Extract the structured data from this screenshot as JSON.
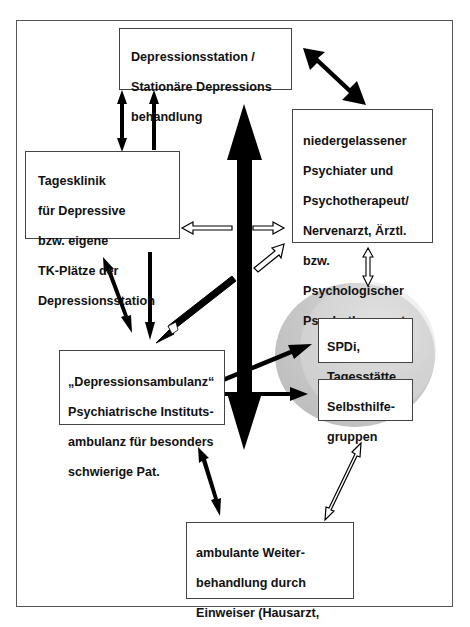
{
  "diagram": {
    "type": "flow-network",
    "nodes": {
      "station": {
        "lines": [
          "Depressionsstation /",
          "Stationäre Depressions",
          "behandlung"
        ]
      },
      "niedergelassen": {
        "lines": [
          "niedergelassener",
          "Psychiater und",
          "Psychotherapeut/",
          "Nervenarzt, Ärztl.",
          "bzw.",
          "Psychologischer",
          "Psychotherapeut"
        ]
      },
      "tagesklinik": {
        "lines": [
          "Tagesklinik",
          "für Depressive",
          "bzw. eigene",
          "TK-Plätze der",
          "Depressionsstation"
        ]
      },
      "ambulanz": {
        "lines": [
          "„Depressionsambulanz“",
          "Psychiatrische Instituts-",
          "ambulanz für besonders",
          "schwierige Pat."
        ]
      },
      "spdi": {
        "lines": [
          "SPDi,",
          "Tagesstätte"
        ]
      },
      "selbsthilfe": {
        "lines": [
          "Selbsthilfe-",
          "gruppen"
        ]
      },
      "weiter": {
        "lines": [
          "ambulante Weiter-",
          "behandlung durch",
          "Einweiser (Hausarzt,",
          "Nervenarzt/Psychiater)"
        ]
      }
    },
    "edges": [
      {
        "from": "station",
        "to": "niedergelassen",
        "style": "bold-double"
      },
      {
        "from": "station",
        "to": "tagesklinik",
        "style": "solid-double"
      },
      {
        "from": "tagesklinik",
        "to": "station",
        "style": "solid-single"
      },
      {
        "from": "central",
        "to": "tagesklinik",
        "style": "hollow-single"
      },
      {
        "from": "central",
        "to": "niedergelassen",
        "style": "hollow-single"
      },
      {
        "from": "ambulanz",
        "to": "niedergelassen",
        "style": "hollow-single"
      },
      {
        "from": "niedergelassen",
        "to": "circle",
        "style": "hollow-double"
      },
      {
        "from": "tagesklinik",
        "to": "ambulanz",
        "style": "solid-double"
      },
      {
        "from": "tagesklinik",
        "to": "ambulanz",
        "style": "solid-single"
      },
      {
        "from": "niedergelassen",
        "to": "ambulanz",
        "style": "hollow-single"
      },
      {
        "from": "ambulanz",
        "to": "spdi",
        "style": "solid-single"
      },
      {
        "from": "ambulanz",
        "to": "selbsthilfe",
        "style": "solid-single"
      },
      {
        "from": "ambulanz",
        "to": "weiter",
        "style": "solid-double"
      },
      {
        "from": "selbsthilfe",
        "to": "weiter",
        "style": "hollow-double"
      },
      {
        "from": "station",
        "to": "weiter",
        "style": "central-bold-double"
      }
    ],
    "colors": {
      "box_border": "#444444",
      "arrow": "#000000",
      "circle_fill": "#c8c8c8",
      "circle_highlight": "#e2e2e2",
      "frame": "#555555"
    }
  }
}
